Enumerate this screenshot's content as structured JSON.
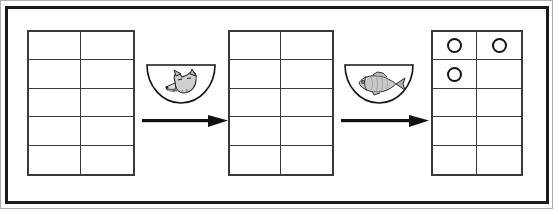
{
  "scene": {
    "title": "Base-ten place value mats with counters transformation sequence",
    "background_color": "#ffffff",
    "frame": {
      "outer_border_color": "#aeaeae",
      "inner_border_color": "#1a1a1a"
    }
  },
  "grids": [
    {
      "id": "grid-1",
      "name": "left-place-value-mat",
      "rows": 5,
      "columns": 2,
      "line_color": "#3a3a3a",
      "x": 27,
      "y": 30,
      "width": 108,
      "height": 146,
      "cells": [
        [
          "",
          ""
        ],
        [
          "",
          ""
        ],
        [
          "",
          ""
        ],
        [
          "",
          ""
        ],
        [
          "",
          ""
        ]
      ],
      "counter_count": 0
    },
    {
      "id": "grid-2",
      "name": "middle-place-value-mat",
      "rows": 5,
      "columns": 2,
      "line_color": "#3a3a3a",
      "x": 228,
      "y": 30,
      "width": 106,
      "height": 146,
      "cells": [
        [
          "",
          ""
        ],
        [
          "",
          ""
        ],
        [
          "",
          ""
        ],
        [
          "",
          ""
        ],
        [
          "",
          ""
        ]
      ],
      "counter_count": 0
    },
    {
      "id": "grid-3",
      "name": "right-place-value-mat",
      "rows": 5,
      "columns": 2,
      "line_color": "#3a3a3a",
      "x": 431,
      "y": 30,
      "width": 92,
      "height": 146,
      "cells": [
        [
          "circle",
          "circle"
        ],
        [
          "circle",
          ""
        ],
        [
          "",
          ""
        ],
        [
          "",
          ""
        ],
        [
          "",
          ""
        ]
      ],
      "counter_count": 3,
      "counter_shape": "open-circle",
      "counter_color": "#141414"
    }
  ],
  "bowls": [
    {
      "id": "bowl-1",
      "name": "fox-bowl",
      "contents": "fox",
      "x": 145,
      "y": 62,
      "width": 72,
      "height": 44,
      "outline_color": "#141414"
    },
    {
      "id": "bowl-2",
      "name": "fish-bowl",
      "contents": "fish",
      "x": 343,
      "y": 62,
      "width": 72,
      "height": 44,
      "outline_color": "#141414"
    }
  ],
  "arrows": [
    {
      "id": "arrow-1",
      "name": "transform-arrow-left",
      "direction": "right",
      "x": 142,
      "y": 112,
      "width": 86,
      "height": 18,
      "color": "#111111"
    },
    {
      "id": "arrow-2",
      "name": "transform-arrow-right",
      "direction": "right",
      "x": 341,
      "y": 112,
      "width": 88,
      "height": 18,
      "color": "#111111"
    }
  ],
  "icons": {
    "fox_label": "fox-icon",
    "fish_label": "fish-icon",
    "bowl_label": "bowl-icon",
    "arrow_label": "arrow-right-icon",
    "circle_label": "counter-circle-icon"
  }
}
